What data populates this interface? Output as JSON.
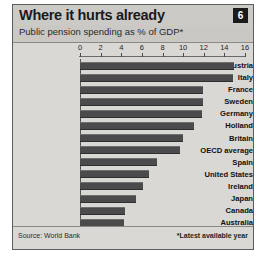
{
  "header": {
    "title": "Where it hurts already",
    "subtitle": "Public pension spending as % of GDP*",
    "badge": "6"
  },
  "footer": {
    "source": "Source: World Bank",
    "footnote": "*Latest available year"
  },
  "chart_data": {
    "type": "bar",
    "orientation": "horizontal",
    "title": "Where it hurts already",
    "subtitle": "Public pension spending as % of GDP*",
    "xlabel": "",
    "ylabel": "",
    "xlim": [
      0,
      16
    ],
    "xticks": [
      0,
      2,
      4,
      6,
      8,
      10,
      12,
      14,
      16
    ],
    "xtick_labels": [
      "0",
      "2",
      "4",
      "6",
      "8",
      "10",
      "12",
      "14",
      "16"
    ],
    "grid": false,
    "legend": "none",
    "bar_color": "#4b4b4b",
    "categories": [
      "Austria",
      "Italy",
      "France",
      "Sweden",
      "Germany",
      "Holland",
      "Britain",
      "OECD average",
      "Spain",
      "United States",
      "Ireland",
      "Japan",
      "Canada",
      "Australia"
    ],
    "values": [
      14.9,
      14.8,
      11.9,
      11.9,
      11.8,
      11.1,
      10.0,
      9.7,
      7.5,
      6.7,
      6.1,
      5.4,
      4.4,
      4.3
    ],
    "source": "Source: World Bank",
    "annotation": "*Latest available year"
  }
}
